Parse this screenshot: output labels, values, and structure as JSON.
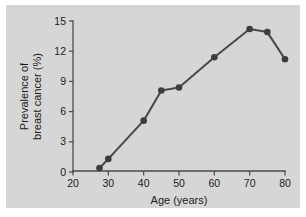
{
  "chart_data": {
    "type": "line",
    "title": "",
    "xlabel": "Age (years)",
    "ylabel": "Prevalence of breast cancer (%)",
    "ylabel_line1": "Prevalence of",
    "ylabel_line2": "breast cancer (%)",
    "xlim": [
      20,
      80
    ],
    "ylim": [
      0,
      15
    ],
    "xticks": [
      20,
      30,
      40,
      50,
      60,
      70,
      80
    ],
    "xtick_labels": [
      "20",
      "30",
      "40",
      "50",
      "60",
      "70",
      "80"
    ],
    "yticks": [
      0,
      3,
      6,
      9,
      12,
      15
    ],
    "ytick_labels": [
      "0",
      "3",
      "6",
      "9",
      "12",
      "15"
    ],
    "grid": false,
    "legend": null,
    "series": [
      {
        "name": "Prevalence of breast cancer",
        "marker": "circle",
        "color": "#3d3d3d",
        "x": [
          27.5,
          30,
          40,
          45,
          50,
          60,
          70,
          75,
          80
        ],
        "y": [
          0.4,
          1.3,
          5.1,
          8.1,
          8.4,
          11.4,
          14.2,
          13.9,
          11.2
        ]
      }
    ]
  },
  "figure": {
    "panel_color": "#d6d6d6",
    "background_color": "#ffffff",
    "axis_color": "#4a4a4a",
    "text_color": "#1c1c1c"
  }
}
